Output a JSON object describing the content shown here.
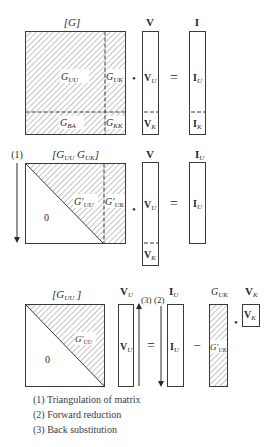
{
  "colors": {
    "line": "#3a3a3a",
    "hatch": "#6e6e6e",
    "background": "#ffffff"
  },
  "panel1": {
    "matrix_label": "[G]",
    "vector_label": "V",
    "rhs_label": "I",
    "blocks": {
      "uu": "G",
      "uu_sub": "UU",
      "uk": "G",
      "uk_sub": "UK",
      "ba": "G",
      "ba_sub": "BA",
      "kk": "G",
      "kk_sub": "KK"
    },
    "vector_parts": {
      "u": "V",
      "u_sub": "U",
      "k": "V",
      "k_sub": "K"
    },
    "rhs_parts": {
      "u": "I",
      "u_sub": "U",
      "k": "I",
      "k_sub": "K"
    },
    "dot": "•",
    "equals": "="
  },
  "panel2": {
    "step_label": "(1)",
    "matrix_label_a": "[G",
    "matrix_label_a_sub": "UU",
    "matrix_label_b": " G",
    "matrix_label_b_sub": "UK",
    "matrix_label_close": "]",
    "vector_label": "V",
    "rhs_label": "I",
    "rhs_label_sub": "U",
    "zero": "0",
    "blocks": {
      "uu": "G′",
      "uu_sub": "UU",
      "uk": "G′",
      "uk_sub": "UK"
    },
    "vector_parts": {
      "u": "V",
      "u_sub": "U",
      "k": "V",
      "k_sub": "K"
    },
    "rhs_parts": {
      "u": "I",
      "u_sub": "U"
    },
    "dot": "•",
    "equals": "="
  },
  "panel3": {
    "matrix_label": "[G",
    "matrix_label_sub": "UU",
    "matrix_label_close": " ]",
    "vector_label": "V",
    "vector_label_sub": "U",
    "rhs_label": "I",
    "rhs_label_sub": "U",
    "guk_label": "G",
    "guk_label_sub": "UK",
    "vk_label": "V",
    "vk_label_sub": "K",
    "zero": "0",
    "step3": "(3)",
    "step2": "(2)",
    "blocks": {
      "uu": "G′",
      "uu_sub": "UU",
      "uk": "G′",
      "uk_sub": "UK"
    },
    "vector_parts": {
      "u": "V",
      "u_sub": "U"
    },
    "rhs_parts": {
      "u": "I",
      "u_sub": "U"
    },
    "vk_part": "V",
    "vk_part_sub": "K",
    "equals": "=",
    "minus": "−",
    "dot": "•"
  },
  "legend": [
    "(1) Triangulation of matrix",
    "(2) Forward reduction",
    "(3) Back substitution"
  ]
}
